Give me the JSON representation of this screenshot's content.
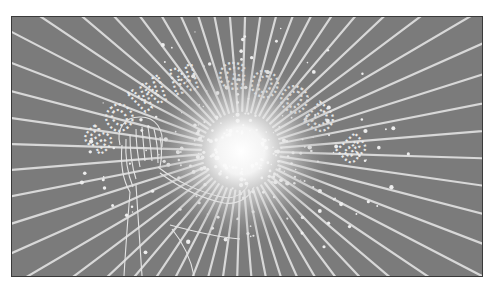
{
  "image": {
    "description": "Grayscale illustration: radiating light rays bursting from a bright center, splattered lettering arching over the burst, and a line-drawn figure with long hair reaching toward the light",
    "colors": {
      "page_background": "#ffffff",
      "frame_border": "#3a3a3a",
      "background_gray": "#7b7b7b",
      "ray_color": "#d8d8d8",
      "burst_core": "#ffffff",
      "line_art": "#e4e4e4"
    },
    "burst_center": {
      "x": 229,
      "y": 134
    },
    "ray_count": 56,
    "splatter_text": "SOWN GOOD BAY",
    "figure": "line-drawn person with long hair, arm reaching toward the light burst"
  }
}
